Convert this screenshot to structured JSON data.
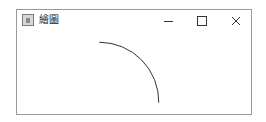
{
  "window": {
    "title": "繪圖",
    "controls": {
      "minimize": "minimize",
      "maximize": "maximize",
      "close": "close"
    }
  },
  "canvas": {
    "shape": "arc",
    "stroke": "#333333"
  }
}
